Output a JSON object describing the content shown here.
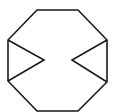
{
  "figure": {
    "stroke_color": "#1a1a1a",
    "background": "#ffffff",
    "stroke_width": 1.6,
    "octagon_points": "37,10 78,10 107,40 107,82 78,111 37,111 8,81 8,40",
    "left_notch_points": "8,40 44,60 8,81",
    "right_notch_points": "107,40 72,60 107,82"
  }
}
